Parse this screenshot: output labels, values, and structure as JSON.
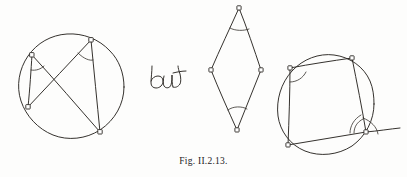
{
  "figure": {
    "caption": "Fig. II.2.13.",
    "conjunction_label": "but",
    "ink_color": "#2a2723",
    "background_color": "#fdfdfc",
    "panels": [
      {
        "name": "left-panel",
        "description": "circle with two inscribed angles subtending the same chord",
        "circle": {
          "cx": 71,
          "cy": 87,
          "r": 53
        },
        "points": [
          {
            "id": "A",
            "x": 32,
            "y": 55
          },
          {
            "id": "B",
            "x": 91,
            "y": 40
          },
          {
            "id": "C",
            "x": 28,
            "y": 107
          },
          {
            "id": "D",
            "x": 100,
            "y": 132
          }
        ],
        "chords": [
          {
            "from": "A",
            "to": "C"
          },
          {
            "from": "A",
            "to": "D"
          },
          {
            "from": "B",
            "to": "C"
          },
          {
            "from": "B",
            "to": "D"
          }
        ],
        "angle_marks": [
          {
            "at": "A",
            "between": [
              "C",
              "D"
            ]
          },
          {
            "at": "B",
            "between": [
              "C",
              "D"
            ]
          }
        ]
      },
      {
        "name": "middle-panel",
        "description": "kite / rhombus with equal opposite angles marked",
        "points": [
          {
            "id": "T",
            "x": 239,
            "y": 8
          },
          {
            "id": "L",
            "x": 211,
            "y": 70
          },
          {
            "id": "R",
            "x": 261,
            "y": 70
          },
          {
            "id": "Bm",
            "x": 237,
            "y": 130
          }
        ],
        "edges": [
          {
            "from": "T",
            "to": "L"
          },
          {
            "from": "T",
            "to": "R"
          },
          {
            "from": "L",
            "to": "Bm"
          },
          {
            "from": "R",
            "to": "Bm"
          }
        ],
        "angle_marks": [
          {
            "at": "T",
            "between": [
              "L",
              "R"
            ]
          },
          {
            "at": "Bm",
            "between": [
              "L",
              "R"
            ]
          }
        ]
      },
      {
        "name": "right-panel",
        "description": "cyclic quadrilateral with interior angle and exterior angle marked",
        "circle": {
          "cx": 326,
          "cy": 104,
          "r": 48
        },
        "points": [
          {
            "id": "P",
            "x": 290,
            "y": 68
          },
          {
            "id": "Q",
            "x": 352,
            "y": 58
          },
          {
            "id": "S",
            "x": 288,
            "y": 145
          },
          {
            "id": "V",
            "x": 366,
            "y": 132
          }
        ],
        "edges": [
          {
            "from": "P",
            "to": "Q"
          },
          {
            "from": "Q",
            "to": "V"
          },
          {
            "from": "V",
            "to": "S"
          },
          {
            "from": "S",
            "to": "P"
          }
        ],
        "extension_ray": {
          "from": "V",
          "to_x": 400,
          "to_y": 128
        },
        "angle_marks": [
          {
            "at": "P",
            "between": [
              "Q",
              "S"
            ]
          },
          {
            "at": "V",
            "between": [
              "Q",
              "S"
            ],
            "kind": "interior"
          },
          {
            "at": "V",
            "between": [
              "Q",
              "extension"
            ],
            "kind": "exterior"
          }
        ]
      }
    ]
  }
}
